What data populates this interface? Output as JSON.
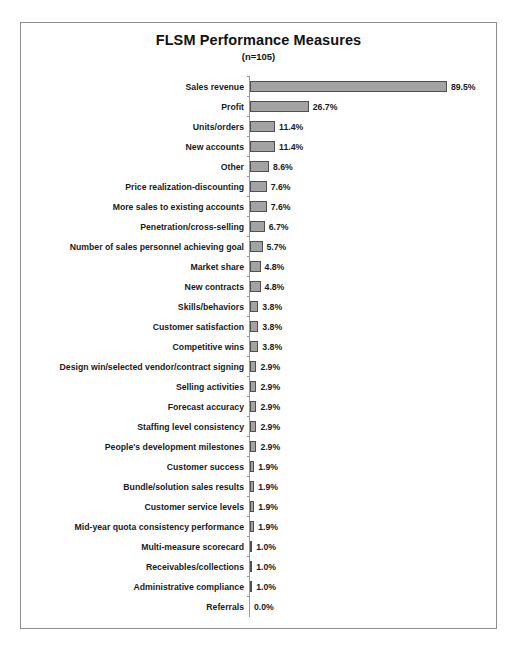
{
  "figure": {
    "title": "FLSM Performance Measures",
    "subtitle": "(n=105)"
  },
  "chart_data": {
    "type": "bar",
    "orientation": "horizontal",
    "title": "FLSM Performance Measures",
    "subtitle": "(n=105)",
    "xlabel": "",
    "ylabel": "",
    "xlim": [
      0,
      100
    ],
    "grid": false,
    "legend": null,
    "sample_size": 105,
    "value_suffix": "%",
    "bar_color": "#a3a3a3",
    "bar_border_color": "#4f4f4f",
    "categories": [
      "Sales revenue",
      "Profit",
      "Units/orders",
      "New accounts",
      "Other",
      "Price realization-discounting",
      "More sales to existing accounts",
      "Penetration/cross-selling",
      "Number of sales personnel achieving goal",
      "Market share",
      "New contracts",
      "Skills/behaviors",
      "Customer satisfaction",
      "Competitive wins",
      "Design win/selected vendor/contract signing",
      "Selling activities",
      "Forecast accuracy",
      "Staffing level consistency",
      "People's development milestones",
      "Customer success",
      "Bundle/solution sales results",
      "Customer service levels",
      "Mid-year quota consistency performance",
      "Multi-measure scorecard",
      "Receivables/collections",
      "Administrative compliance",
      "Referrals"
    ],
    "values": [
      89.5,
      26.7,
      11.4,
      11.4,
      8.6,
      7.6,
      7.6,
      6.7,
      5.7,
      4.8,
      4.8,
      3.8,
      3.8,
      3.8,
      2.9,
      2.9,
      2.9,
      2.9,
      2.9,
      1.9,
      1.9,
      1.9,
      1.9,
      1.0,
      1.0,
      1.0,
      0.0
    ],
    "value_labels": [
      "89.5%",
      "26.7%",
      "11.4%",
      "11.4%",
      "8.6%",
      "7.6%",
      "7.6%",
      "6.7%",
      "5.7%",
      "4.8%",
      "4.8%",
      "3.8%",
      "3.8%",
      "3.8%",
      "2.9%",
      "2.9%",
      "2.9%",
      "2.9%",
      "2.9%",
      "1.9%",
      "1.9%",
      "1.9%",
      "1.9%",
      "1.0%",
      "1.0%",
      "1.0%",
      "0.0%"
    ]
  }
}
